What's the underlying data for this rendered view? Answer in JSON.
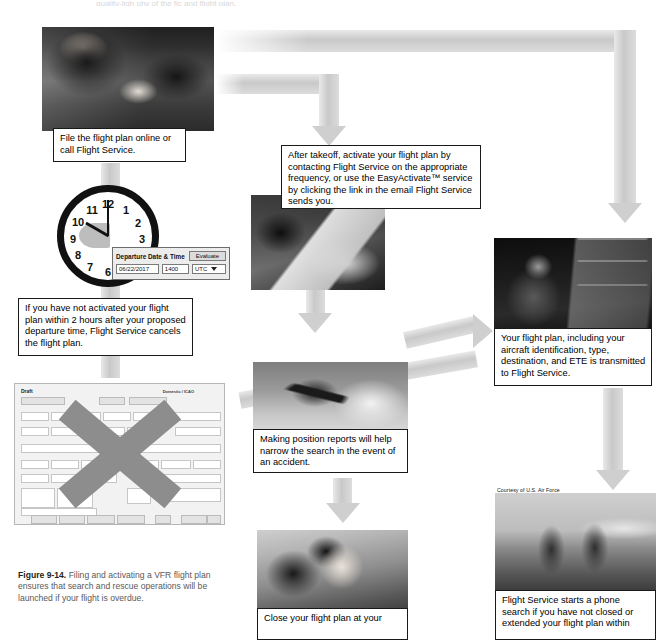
{
  "figure": {
    "label": "Figure 9-14.",
    "caption": "Filing and activating a VFR flight plan ensures that search and rescue operations will be launched if your flight is overdue."
  },
  "top_cropped_text": "quality-ligh                 phy                     of the                         fic             and                       flight plan.",
  "steps": [
    {
      "id": "file-flight-plan",
      "caption": "File the flight plan online or call Flight Service.",
      "photo_alt": "pilot-with-tablet-photo"
    },
    {
      "id": "activate-flight-plan",
      "caption": "After takeoff, activate your flight plan by contacting Flight Service on the appropriate frequency, or use the EasyActivate™ service by clicking the link in the email Flight Service sends you.",
      "photo_alt": "tablet-in-cockpit-photo"
    },
    {
      "id": "transmitted-to-flight-service",
      "caption": "Your flight plan, including your aircraft identification, type, destination, and ETE is transmitted to Flight Service.",
      "photo_alt": "flight-service-specialist-photo"
    },
    {
      "id": "not-activated-cancels",
      "caption": "If you have not activated your flight plan within 2 hours after your proposed departure time, Flight Service cancels the flight plan."
    },
    {
      "id": "position-reports",
      "caption": "Making position reports will help narrow the search in the event of an accident.",
      "photo_alt": "cessna-in-flight-photo"
    },
    {
      "id": "close-flight-plan",
      "caption": "Close your flight plan at your",
      "photo_alt": "person-on-phone-photo"
    },
    {
      "id": "phone-search",
      "caption": "Flight Service starts a phone search if you have not closed or extended your flight plan within",
      "photo_alt": "search-and-rescue-crew-photo",
      "credit": "Courtesy of U.S. Air Force"
    }
  ],
  "departure_widget": {
    "title": "Departure Date & Time",
    "evaluate_button": "Evaluate",
    "date_value": "06/22/2017",
    "time_value": "1400",
    "zone_value": "UTC",
    "zone_options": [
      "UTC",
      "Local"
    ]
  },
  "clock": {
    "numbers": [
      "12",
      "1",
      "2",
      "3",
      "4",
      "5",
      "6",
      "7",
      "8",
      "9",
      "10",
      "11"
    ],
    "hour": 10,
    "minute": 0
  },
  "flight_plan_form": {
    "status": "Draft",
    "top_right_label": "Domestic / ICAO",
    "buttons_top": [
      "Recent Flight Plans",
      "Route",
      "Save as Favorite"
    ],
    "fields": [
      {
        "label": "Aircraft ID",
        "value": "N824X"
      },
      {
        "label": "Flight Rule",
        "value": "VFR"
      },
      {
        "label": "No. of Aircraft",
        "value": "1"
      },
      {
        "label": "Aircraft Type",
        "value": "C172"
      },
      {
        "label": "Status",
        "value": ""
      },
      {
        "label": "Departure",
        "value": "KHYI"
      },
      {
        "label": "Airport Info",
        "value": "Local Brief"
      },
      {
        "label": "Departure Date & Time",
        "value": "06/22/2017 1400"
      },
      {
        "label": "Cruising Speed",
        "value": "105 kt"
      },
      {
        "label": "Equipment",
        "value": ""
      },
      {
        "label": "Surveillance Equipment",
        "value": "ESQ"
      },
      {
        "label": "Route of Flight",
        "value": "DCT RNB DCT CRP DCT PTS DCT"
      },
      {
        "label": "Destination",
        "value": "KSAT"
      },
      {
        "label": "Total Estimated Elapsed Time",
        "value": "0215"
      },
      {
        "label": "Fuel on Board",
        "value": ""
      },
      {
        "label": "Alternate 1 (Optional)",
        "value": ""
      },
      {
        "label": "Alternate 2 (Optional)",
        "value": ""
      },
      {
        "label": "Fuel Endurance",
        "value": "0400"
      },
      {
        "label": "Persons on Board",
        "value": "2"
      },
      {
        "label": "Aircraft Color",
        "value": "W/B"
      },
      {
        "label": "Pilot in Command (Optional)",
        "value": "B. HARRISON / 512-555-0100"
      },
      {
        "label": "Emergency Radios",
        "value": "UHF VHF ELBA"
      },
      {
        "label": "Survival Equipment",
        "value": "Polar Desert Maritime Jungle"
      },
      {
        "label": "Dinghies",
        "value": "Number Capacity"
      },
      {
        "label": "Remarks",
        "value": ""
      },
      {
        "label": "Other Contact Information",
        "value": "J. HARRISON / 512-555-0188"
      },
      {
        "label": "Weight and Balance",
        "value": ""
      },
      {
        "label": "Flight Altitude / Heading",
        "value": ""
      }
    ],
    "buttons_bottom": [
      "Request Brief",
      "Submit Brief",
      "Abbreviated Brief",
      "Scheduled Brief",
      "File",
      "Clean Up",
      "Active Flight Plan",
      "Clear"
    ]
  },
  "colors": {
    "arrow": "#cfcfcf",
    "x_overlay": "#8d8d8d",
    "caption_border": "#1a1a1a",
    "figcaption_text": "#58595b"
  }
}
